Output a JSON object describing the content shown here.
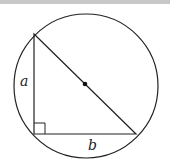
{
  "diagram": {
    "type": "geometry",
    "labels": {
      "leg_vertical": "a",
      "leg_horizontal": "b"
    },
    "circle": {
      "cx": 86,
      "cy": 86,
      "r": 72
    },
    "triangle": {
      "top": [
        34,
        34
      ],
      "right_angle": [
        34,
        134
      ],
      "right": [
        136,
        134
      ]
    },
    "center_point": [
      85,
      84
    ],
    "right_angle_marker_size": 11,
    "colors": {
      "stroke": "#222222",
      "topbar": "#c8c8c8"
    }
  }
}
